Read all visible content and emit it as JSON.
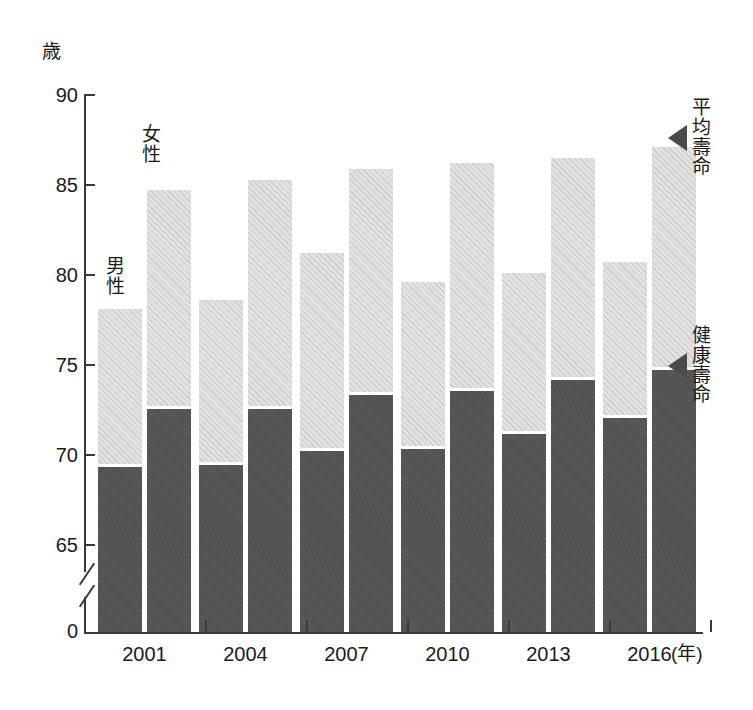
{
  "chart_data": {
    "type": "bar",
    "title": "",
    "subtitle": "",
    "xlabel": "(年)",
    "ylabel": "歳",
    "ylim": [
      63.5,
      90
    ],
    "yticks": [
      65,
      70,
      75,
      80,
      85,
      90
    ],
    "ytick_labels": [
      "65",
      "70",
      "75",
      "80",
      "85",
      "90"
    ],
    "y_origin_label": "0",
    "axis_break": true,
    "grid": false,
    "legend_position": "in-plot",
    "categories": [
      "2001",
      "2004",
      "2007",
      "2010",
      "2013",
      "2016"
    ],
    "group_labels": [
      "男性",
      "女性"
    ],
    "stack_labels": [
      "健康壽命",
      "平均壽命"
    ],
    "series": [
      {
        "name": "男性 健康壽命",
        "group": "男性",
        "segment": "健康壽命",
        "color": "#555555",
        "values": [
          69.4,
          69.5,
          70.3,
          70.4,
          71.2,
          72.1
        ]
      },
      {
        "name": "男性 平均壽命",
        "group": "男性",
        "segment": "平均壽命",
        "color": "#e2e2e2",
        "values": [
          78.1,
          78.6,
          81.2,
          79.6,
          80.1,
          80.7
        ]
      },
      {
        "name": "女性 健康壽命",
        "group": "女性",
        "segment": "健康壽命",
        "color": "#555555",
        "values": [
          72.6,
          72.6,
          73.4,
          73.6,
          74.2,
          74.8
        ]
      },
      {
        "name": "女性 平均壽命",
        "group": "女性",
        "segment": "平均壽命",
        "color": "#e2e2e2",
        "values": [
          84.7,
          85.3,
          85.9,
          86.2,
          86.5,
          87.1
        ]
      }
    ],
    "annotations": [
      {
        "text": "平均壽命",
        "target": "female-2016-average-top",
        "arrow": "left"
      },
      {
        "text": "健康壽命",
        "target": "female-2016-healthy-top",
        "arrow": "left"
      }
    ]
  },
  "axis": {
    "unit_label": "歳",
    "x_unit_label": "(年)"
  },
  "series_labels": {
    "male": "男\n性",
    "female": "女\n性"
  },
  "annotations": {
    "average": "平\n均\n壽\n命",
    "healthy": "健\n康\n壽\n命"
  }
}
